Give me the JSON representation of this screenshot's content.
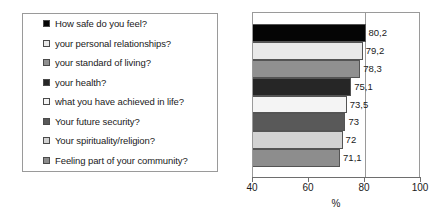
{
  "chart_data": {
    "type": "bar",
    "orientation": "horizontal",
    "title": "",
    "subtitle": "",
    "xlabel": "%",
    "ylabel": "",
    "xlim": [
      40,
      100
    ],
    "xticks": [
      40,
      60,
      80,
      100
    ],
    "xtick_labels": [
      "40",
      "60",
      "80",
      "100"
    ],
    "grid": true,
    "gridlines_x": [
      80
    ],
    "legend_position": "left-outside",
    "decimal_separator": ",",
    "categories": [
      "How safe do you feel?",
      "your personal relationships?",
      "your standard of living?",
      "your health?",
      "what you have achieved in life?",
      "Your future security?",
      "Your spirituality/religion?",
      "Feeling part of your community?"
    ],
    "values": [
      80.2,
      79.2,
      78.3,
      75.1,
      73.5,
      73,
      72,
      71.1
    ],
    "value_labels": [
      "80,2",
      "79,2",
      "78,3",
      "75,1",
      "73,5",
      "73",
      "72",
      "71,1"
    ],
    "colors": [
      "#050505",
      "#e9e9e9",
      "#909090",
      "#262626",
      "#f4f4f4",
      "#595959",
      "#d2d2d2",
      "#8d8d8d"
    ]
  },
  "legend": {
    "items": [
      {
        "label": "How safe do you feel?",
        "color": "#050505"
      },
      {
        "label": "your personal relationships?",
        "color": "#e9e9e9"
      },
      {
        "label": "your standard of living?",
        "color": "#909090"
      },
      {
        "label": "your health?",
        "color": "#262626"
      },
      {
        "label": "what you have achieved in life?",
        "color": "#f4f4f4"
      },
      {
        "label": "Your future security?",
        "color": "#595959"
      },
      {
        "label": "Your spirituality/religion?",
        "color": "#d2d2d2"
      },
      {
        "label": "Feeling part of your community?",
        "color": "#8d8d8d"
      }
    ]
  },
  "axis": {
    "x_label": "%",
    "ticks": [
      "40",
      "60",
      "80",
      "100"
    ]
  }
}
